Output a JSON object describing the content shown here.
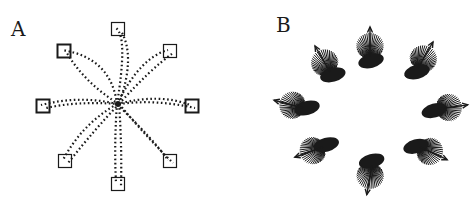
{
  "figure": {
    "panels": [
      {
        "label": "A",
        "description": "Center-out reaching trajectories (dotted) to eight peripheral targets",
        "targets": [
          {
            "name": "top",
            "direction_deg": 90,
            "highlighted": false
          },
          {
            "name": "top-right",
            "direction_deg": 45,
            "highlighted": false
          },
          {
            "name": "right",
            "direction_deg": 0,
            "highlighted": true
          },
          {
            "name": "bottom-right",
            "direction_deg": -45,
            "highlighted": false
          },
          {
            "name": "bottom",
            "direction_deg": -90,
            "highlighted": false
          },
          {
            "name": "bottom-left",
            "direction_deg": -135,
            "highlighted": false
          },
          {
            "name": "left",
            "direction_deg": 180,
            "highlighted": true
          },
          {
            "name": "top-left",
            "direction_deg": 135,
            "highlighted": true
          }
        ]
      },
      {
        "label": "B",
        "description": "Population vectors: fan of neuronal contribution vectors per direction with resultant arrow",
        "clusters": [
          {
            "name": "top",
            "direction_deg": 90
          },
          {
            "name": "top-right",
            "direction_deg": 60
          },
          {
            "name": "right",
            "direction_deg": 8
          },
          {
            "name": "bottom-right",
            "direction_deg": -25
          },
          {
            "name": "bottom",
            "direction_deg": -100
          },
          {
            "name": "bottom-left",
            "direction_deg": -160
          },
          {
            "name": "left",
            "direction_deg": 165
          },
          {
            "name": "top-left",
            "direction_deg": 120
          }
        ]
      }
    ],
    "colors": {
      "ink": "#1a1a1a",
      "background": "#ffffff"
    }
  }
}
